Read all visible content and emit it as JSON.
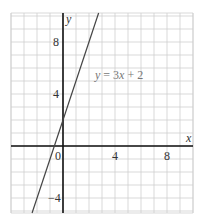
{
  "chart_data": {
    "type": "line",
    "title": "",
    "xlabel": "x",
    "ylabel": "y",
    "xlim": [
      -4,
      10
    ],
    "ylim": [
      -5,
      10.2
    ],
    "grid": true,
    "grid_step": 1,
    "x_ticks": [
      0,
      4,
      8
    ],
    "x_tick_labels": [
      "0",
      "4",
      "8"
    ],
    "y_ticks": [
      8,
      4,
      -4
    ],
    "y_tick_labels": [
      "8",
      "4",
      "−4"
    ],
    "series": [
      {
        "name": "y = 3x + 2",
        "equation": {
          "slope": 3,
          "intercept": 2
        },
        "x": [
          -2.38,
          -2,
          -1,
          0,
          1,
          2,
          2.74
        ],
        "values": [
          -5.15,
          -4,
          -1,
          2,
          5,
          8,
          10.23
        ]
      }
    ],
    "annotations": [
      {
        "text": "y = 3x + 2",
        "x": 2.4,
        "y": 5.2
      }
    ],
    "colors": {
      "grid": "#cfcfcf",
      "axis": "#111111",
      "line": "#444444",
      "label": "#777777"
    }
  },
  "labels": {
    "x_axis": "x",
    "y_axis": "y",
    "origin": "0",
    "x_tick_4": "4",
    "x_tick_8": "8",
    "y_tick_8": "8",
    "y_tick_4": "4",
    "y_tick_neg4": "−4",
    "equation_y": "y",
    "equation_mid": " = 3",
    "equation_x": "x",
    "equation_end": " + 2"
  }
}
